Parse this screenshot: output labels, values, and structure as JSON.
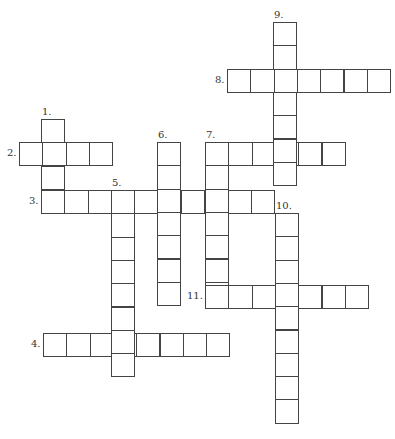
{
  "puzzle": {
    "cell_size": 23.3,
    "words": [
      {
        "number": "1.",
        "dir": "down",
        "x": 41,
        "y": 119,
        "length": 4,
        "label_pos": "above"
      },
      {
        "number": "2.",
        "dir": "across",
        "x": 19,
        "y": 142,
        "length": 4,
        "label_pos": "left"
      },
      {
        "number": "3.",
        "dir": "across",
        "x": 41,
        "y": 190,
        "length": 10,
        "label_pos": "left"
      },
      {
        "number": "4.",
        "dir": "across",
        "x": 43,
        "y": 333,
        "length": 8,
        "label_pos": "left"
      },
      {
        "number": "5.",
        "dir": "down",
        "x": 111,
        "y": 190,
        "length": 8,
        "label_pos": "above"
      },
      {
        "number": "6.",
        "dir": "down",
        "x": 157,
        "y": 142,
        "length": 7,
        "label_pos": "above"
      },
      {
        "number": "7.",
        "dir": "across",
        "x": 205,
        "y": 142,
        "length": 6,
        "label_pos": "above"
      },
      {
        "number": "",
        "dir": "down",
        "x": 205,
        "y": 142,
        "length": 7,
        "label_pos": "none"
      },
      {
        "number": "8.",
        "dir": "across",
        "x": 227,
        "y": 69,
        "length": 7,
        "label_pos": "left"
      },
      {
        "number": "9.",
        "dir": "down",
        "x": 273,
        "y": 22,
        "length": 7,
        "label_pos": "above"
      },
      {
        "number": "10.",
        "dir": "down",
        "x": 275,
        "y": 213,
        "length": 9,
        "label_pos": "above"
      },
      {
        "number": "11.",
        "dir": "across",
        "x": 205,
        "y": 285,
        "length": 7,
        "label_pos": "left"
      }
    ]
  }
}
